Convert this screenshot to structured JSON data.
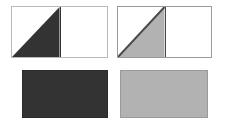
{
  "canvas": {
    "width": 225,
    "height": 128,
    "background_color": "#ffffff"
  },
  "panels": [
    {
      "id": "top-left",
      "role": "figure-diagonal-fill-dark",
      "shape": "rectangle-with-right-triangle",
      "fill_region": "left-half-lower-triangle",
      "triangle_vertices": "bottom-left, top-center, bottom-center",
      "background_color": "#ffffff",
      "border_color": "#b9b9b9",
      "fill_color": "#333333",
      "outline_color": "#333333",
      "x": 11,
      "y": 6,
      "width": 97,
      "height": 52
    },
    {
      "id": "top-right",
      "role": "figure-diagonal-fill-light",
      "shape": "rectangle-with-right-triangle",
      "fill_region": "left-half-lower-triangle",
      "triangle_vertices": "bottom-left, top-center, bottom-center",
      "background_color": "#ffffff",
      "border_color": "#9a9a9a",
      "fill_color": "#b2b2b2",
      "outline_color": "#4a4a4a",
      "x": 117,
      "y": 6,
      "width": 95,
      "height": 52
    },
    {
      "id": "bottom-left",
      "role": "swatch-solid-dark",
      "shape": "rectangle",
      "fill_region": "full",
      "background_color": "#333333",
      "border_color": "#2b2b2b",
      "fill_color": "#333333",
      "x": 22,
      "y": 70,
      "width": 86,
      "height": 48
    },
    {
      "id": "bottom-right",
      "role": "swatch-solid-light",
      "shape": "rectangle",
      "fill_region": "full",
      "background_color": "#b2b2b2",
      "border_color": "#9a9a9a",
      "fill_color": "#b2b2b2",
      "x": 120,
      "y": 70,
      "width": 88,
      "height": 48
    }
  ],
  "colors": {
    "dark": "#333333",
    "light_gray": "#b2b2b2",
    "white": "#ffffff",
    "border_light": "#b9b9b9",
    "border_mid": "#9a9a9a",
    "outline_dark": "#4a4a4a"
  }
}
